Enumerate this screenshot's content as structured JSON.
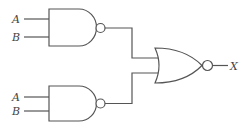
{
  "diagram": {
    "type": "logic-circuit",
    "gates": [
      {
        "id": "nand-top",
        "type": "NAND",
        "inputs": [
          "A",
          "B"
        ]
      },
      {
        "id": "nand-bottom",
        "type": "NAND",
        "inputs": [
          "A",
          "B"
        ]
      },
      {
        "id": "nor-output",
        "type": "NOR",
        "inputs": [
          "nand-top",
          "nand-bottom"
        ],
        "output": "X"
      }
    ],
    "labels": {
      "top_a": "A",
      "top_b": "B",
      "bottom_a": "A",
      "bottom_b": "B",
      "output": "X"
    }
  }
}
